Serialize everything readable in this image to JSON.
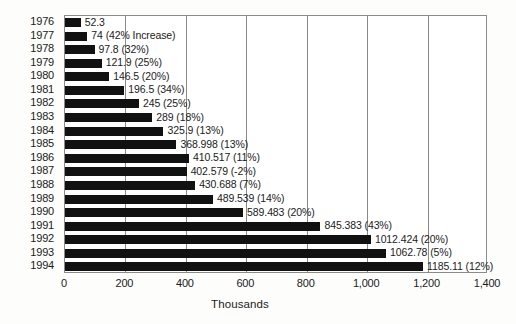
{
  "chart_data": {
    "type": "bar",
    "orientation": "horizontal",
    "title": "",
    "xlabel": "Thousands",
    "ylabel": "",
    "xlim": [
      0,
      1400
    ],
    "xticks": [
      "0",
      "200",
      "400",
      "600",
      "800",
      "1,000",
      "1,200",
      "1,400"
    ],
    "xtick_values": [
      0,
      200,
      400,
      600,
      800,
      1000,
      1200,
      1400
    ],
    "grid": true,
    "legend": "none",
    "categories": [
      "1976",
      "1977",
      "1978",
      "1979",
      "1980",
      "1981",
      "1982",
      "1983",
      "1984",
      "1985",
      "1986",
      "1987",
      "1988",
      "1989",
      "1990",
      "1991",
      "1992",
      "1993",
      "1994"
    ],
    "values": [
      52.3,
      74,
      97.8,
      121.9,
      146.5,
      196.5,
      245,
      289,
      325.9,
      368.998,
      410.517,
      402.579,
      430.688,
      489.539,
      589.483,
      845.383,
      1012.424,
      1062.78,
      1185.11
    ],
    "data_labels": [
      "52.3",
      "74 (42% Increase)",
      "97.8 (32%)",
      "121.9 (25%)",
      "146.5 (20%)",
      "196.5 (34%)",
      "245 (25%)",
      "289 (18%)",
      "325.9 (13%)",
      "368.998 (13%)",
      "410.517 (11%)",
      "402.579 (-2%)",
      "430.688 (7%)",
      "489.539 (14%)",
      "589.483 (20%)",
      "845.383 (43%)",
      "1012.424 (20%)",
      "1062.78 (5%)",
      "1185.11 (12%)"
    ],
    "percent_change": [
      null,
      "42% Increase",
      "32%",
      "25%",
      "20%",
      "34%",
      "25%",
      "18%",
      "13%",
      "13%",
      "11%",
      "-2%",
      "7%",
      "14%",
      "20%",
      "43%",
      "20%",
      "5%",
      "12%"
    ],
    "bar_color": "#111111",
    "background_color": "#ffffff"
  }
}
